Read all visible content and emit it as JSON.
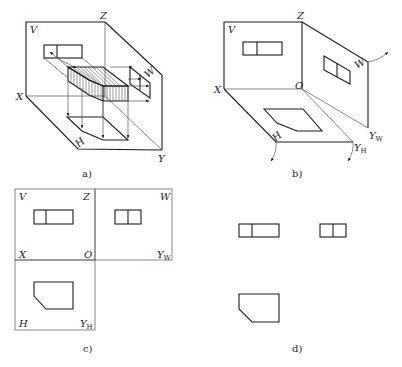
{
  "figure": {
    "panels": [
      {
        "id": "a",
        "caption": "a)",
        "description": "Isometric view of object placed in three-plane projection system with projection rays",
        "labels": {
          "V": "V",
          "Z": "Z",
          "W": "W",
          "X": "X",
          "H": "H",
          "Y": "Y"
        }
      },
      {
        "id": "b",
        "caption": "b)",
        "description": "Three projection planes with views, H and W planes rotating open",
        "labels": {
          "V": "V",
          "Z": "Z",
          "W": "W",
          "X": "X",
          "O": "O",
          "H": "H",
          "YW": "Y",
          "YW_sub": "W",
          "YH": "Y",
          "YH_sub": "H"
        }
      },
      {
        "id": "c",
        "caption": "c)",
        "description": "Unfolded projection planes with three views and axes",
        "labels": {
          "V": "V",
          "Z": "Z",
          "W": "W",
          "X": "X",
          "O": "O",
          "YW": "Y",
          "YW_sub": "W",
          "H": "H",
          "YH": "Y",
          "YH_sub": "H"
        }
      },
      {
        "id": "d",
        "caption": "d)",
        "description": "Final three-view drawing without plane borders"
      }
    ],
    "colors": {
      "line": "#1a1a1a",
      "background": "#ffffff"
    }
  }
}
